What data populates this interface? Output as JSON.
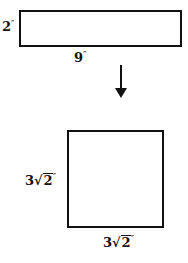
{
  "diagram": {
    "top_shape": {
      "type": "rectangle",
      "height_label": "2",
      "width_label": "9",
      "unit": "″"
    },
    "transform_arrow": {
      "direction": "down"
    },
    "bottom_shape": {
      "type": "square",
      "side_label_coef": "3",
      "side_label_radical": "2",
      "side_label_symbol": "√",
      "unit": "″"
    }
  }
}
